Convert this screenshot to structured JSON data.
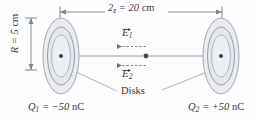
{
  "figure": {
    "colors": {
      "disk_fill_outer": "#e9ebf0",
      "disk_fill_inner": "#e4e7ee",
      "disk_stroke": "#9aa0ad",
      "disk_ring_stroke": "#8e94a2",
      "axis_line": "#8f95a2",
      "dimension_line": "#7c828f",
      "leader_line": "#9aa0ad",
      "text": "#3a3a45",
      "dot": "#4a4a55",
      "background": "#fdfdfd"
    },
    "dimensions": {
      "horizontal": {
        "symbol": "2z",
        "equals": "=",
        "value": "20",
        "unit": "cm",
        "full_text": "2z = 20 cm"
      },
      "vertical": {
        "symbol": "R",
        "equals": "=",
        "value": "5",
        "unit": "cm",
        "full_text": "R = 5 cm"
      }
    },
    "fields": [
      {
        "symbol": "E",
        "subscript": "1",
        "label": "E⃗1",
        "direction": "left",
        "position": "above-axis"
      },
      {
        "symbol": "E",
        "subscript": "2",
        "label": "E⃗2",
        "direction": "left",
        "position": "below-axis"
      }
    ],
    "disks_label": "Disks",
    "charges": [
      {
        "symbol": "Q",
        "subscript": "1",
        "equals": "=",
        "value": "−50",
        "unit": "nC",
        "full_text": "Q1 = −50 nC",
        "side": "left"
      },
      {
        "symbol": "Q",
        "subscript": "2",
        "equals": "=",
        "value": "+50",
        "unit": "nC",
        "full_text": "Q2 = +50 nC",
        "side": "right"
      }
    ]
  }
}
